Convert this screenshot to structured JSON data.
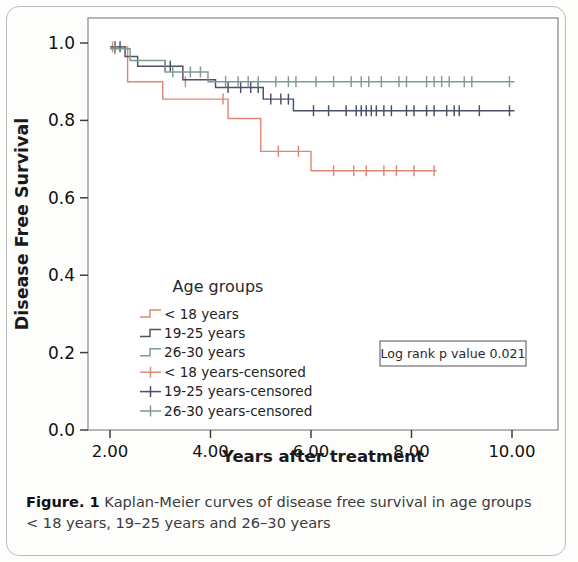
{
  "figure": {
    "caption_label": "Figure. 1",
    "caption_text": " Kaplan-Meier curves of disease free survival in age groups < 18 years, 19–25 years and 26–30 years"
  },
  "annotations": {
    "logrank_box": "Log rank p value 0.021"
  },
  "legend": {
    "title": "Age groups",
    "items": [
      {
        "label": "< 18 years",
        "color": "#e08878",
        "marker": "step"
      },
      {
        "label": "19-25 years",
        "color": "#4a5068",
        "marker": "step"
      },
      {
        "label": "26-30 years",
        "color": "#7e9a94",
        "marker": "step"
      },
      {
        "label": "< 18 years-censored",
        "color": "#e08878",
        "marker": "cross"
      },
      {
        "label": "19-25 years-censored",
        "color": "#4a5068",
        "marker": "cross"
      },
      {
        "label": "26-30 years-censored",
        "color": "#7e9a94",
        "marker": "cross"
      }
    ]
  },
  "chart_data": {
    "type": "line",
    "subtype": "kaplan-meier-step",
    "title": "",
    "xlabel": "Years after treatment",
    "ylabel": "Disease Free Survival",
    "xlim": [
      1.5,
      10.6
    ],
    "ylim": [
      0.0,
      1.04
    ],
    "xticks": [
      2.0,
      4.0,
      6.0,
      8.0,
      10.0
    ],
    "xtick_labels": [
      "2.00",
      "4.00",
      "6.00",
      "8.00",
      "10.00"
    ],
    "yticks": [
      0.0,
      0.2,
      0.4,
      0.6,
      0.8,
      1.0
    ],
    "ytick_labels": [
      "0.0",
      "0.2",
      "0.4",
      "0.6",
      "0.8",
      "1.0"
    ],
    "grid": false,
    "legend_position": "inside-lower-left",
    "series": [
      {
        "name": "< 18 years",
        "color": "#e08878",
        "steps": [
          [
            2.0,
            0.99
          ],
          [
            2.35,
            0.99
          ],
          [
            2.35,
            0.9
          ],
          [
            3.05,
            0.9
          ],
          [
            3.05,
            0.855
          ],
          [
            4.35,
            0.855
          ],
          [
            4.35,
            0.805
          ],
          [
            5.0,
            0.805
          ],
          [
            5.0,
            0.72
          ],
          [
            6.0,
            0.72
          ],
          [
            6.0,
            0.67
          ],
          [
            8.5,
            0.67
          ]
        ],
        "censored_x": [
          2.05,
          3.5,
          4.25,
          5.35,
          5.75,
          6.45,
          6.85,
          7.1,
          7.45,
          7.7,
          8.05,
          8.45
        ],
        "censored_y": [
          0.99,
          0.9,
          0.855,
          0.72,
          0.72,
          0.67,
          0.67,
          0.67,
          0.67,
          0.67,
          0.67,
          0.67
        ],
        "final_survival": 0.67
      },
      {
        "name": "19-25 years",
        "color": "#4a5068",
        "steps": [
          [
            2.0,
            0.99
          ],
          [
            2.3,
            0.99
          ],
          [
            2.3,
            0.965
          ],
          [
            2.55,
            0.965
          ],
          [
            2.55,
            0.94
          ],
          [
            3.45,
            0.94
          ],
          [
            3.45,
            0.905
          ],
          [
            4.1,
            0.905
          ],
          [
            4.1,
            0.885
          ],
          [
            5.05,
            0.885
          ],
          [
            5.05,
            0.855
          ],
          [
            5.65,
            0.855
          ],
          [
            5.65,
            0.825
          ],
          [
            10.05,
            0.825
          ]
        ],
        "censored_x": [
          2.1,
          2.2,
          3.1,
          3.2,
          4.35,
          4.6,
          4.8,
          4.95,
          5.2,
          5.4,
          5.55,
          6.05,
          6.35,
          6.7,
          6.9,
          7.0,
          7.1,
          7.2,
          7.3,
          7.45,
          7.6,
          7.9,
          8.05,
          8.3,
          8.45,
          8.7,
          8.85,
          8.95,
          9.35,
          9.95
        ],
        "censored_y": [
          0.99,
          0.99,
          0.94,
          0.94,
          0.885,
          0.885,
          0.885,
          0.885,
          0.855,
          0.855,
          0.855,
          0.825,
          0.825,
          0.825,
          0.825,
          0.825,
          0.825,
          0.825,
          0.825,
          0.825,
          0.825,
          0.825,
          0.825,
          0.825,
          0.825,
          0.825,
          0.825,
          0.825,
          0.825,
          0.825
        ],
        "final_survival": 0.825
      },
      {
        "name": "26-30 years",
        "color": "#7e9a94",
        "steps": [
          [
            2.0,
            0.985
          ],
          [
            2.4,
            0.985
          ],
          [
            2.4,
            0.955
          ],
          [
            3.1,
            0.955
          ],
          [
            3.1,
            0.925
          ],
          [
            3.95,
            0.925
          ],
          [
            3.95,
            0.9
          ],
          [
            10.05,
            0.9
          ]
        ],
        "censored_x": [
          2.1,
          3.25,
          3.6,
          3.8,
          4.3,
          4.55,
          4.75,
          4.95,
          5.3,
          5.55,
          5.7,
          6.1,
          6.45,
          6.8,
          7.0,
          7.15,
          7.4,
          7.75,
          7.9,
          8.3,
          8.45,
          8.6,
          8.75,
          9.05,
          9.2,
          9.95
        ],
        "censored_y": [
          0.985,
          0.925,
          0.925,
          0.925,
          0.9,
          0.9,
          0.9,
          0.9,
          0.9,
          0.9,
          0.9,
          0.9,
          0.9,
          0.9,
          0.9,
          0.9,
          0.9,
          0.9,
          0.9,
          0.9,
          0.9,
          0.9,
          0.9,
          0.9,
          0.9,
          0.9
        ],
        "final_survival": 0.9
      }
    ]
  }
}
